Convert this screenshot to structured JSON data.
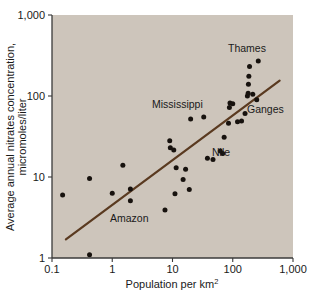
{
  "chart_data": {
    "type": "scatter",
    "title": "",
    "xlabel": "Population per km2",
    "xlabel_base": "Population per km",
    "xlabel_exponent": "2",
    "ylabel": "Average annual nitrates concentration, micromoles/liter",
    "ylabel_line1": "Average annual nitrates concentration,",
    "ylabel_line2": "micromoles/liter",
    "xscale": "log",
    "yscale": "log",
    "xlim": [
      0.1,
      1000
    ],
    "ylim": [
      1,
      1000
    ],
    "xticks": [
      0.1,
      1,
      10,
      100,
      1000
    ],
    "xtick_labels": [
      "0.1",
      "1",
      "10",
      "100",
      "1,000"
    ],
    "yticks": [
      1,
      10,
      100,
      1000
    ],
    "ytick_labels": [
      "1",
      "10",
      "100",
      "1,000"
    ],
    "grid": false,
    "legend": "none",
    "plot_background_color": "#cdc5bb",
    "point_color": "#17120e",
    "trendline_color": "#5a3a20",
    "points": [
      {
        "x": 0.15,
        "y": 6.0
      },
      {
        "x": 0.42,
        "y": 1.1
      },
      {
        "x": 0.42,
        "y": 9.6
      },
      {
        "x": 1.0,
        "y": 6.3
      },
      {
        "x": 1.5,
        "y": 14.0
      },
      {
        "x": 2.0,
        "y": 5.1
      },
      {
        "x": 2.0,
        "y": 7.1
      },
      {
        "x": 7.5,
        "y": 3.9
      },
      {
        "x": 9.0,
        "y": 28.0
      },
      {
        "x": 9.2,
        "y": 23.0
      },
      {
        "x": 10.5,
        "y": 21.5
      },
      {
        "x": 11.0,
        "y": 6.2
      },
      {
        "x": 11.5,
        "y": 13.0
      },
      {
        "x": 15.0,
        "y": 9.3
      },
      {
        "x": 16.5,
        "y": 12.5
      },
      {
        "x": 19.0,
        "y": 7.0
      },
      {
        "x": 20.0,
        "y": 52.0
      },
      {
        "x": 33.0,
        "y": 55.0
      },
      {
        "x": 38.0,
        "y": 17.0
      },
      {
        "x": 47.0,
        "y": 16.5
      },
      {
        "x": 62.0,
        "y": 21.0
      },
      {
        "x": 68.0,
        "y": 19.5
      },
      {
        "x": 72.0,
        "y": 31.0
      },
      {
        "x": 85.0,
        "y": 46.0
      },
      {
        "x": 88.0,
        "y": 72.0
      },
      {
        "x": 90.0,
        "y": 82.0
      },
      {
        "x": 100.0,
        "y": 80.0
      },
      {
        "x": 120.0,
        "y": 48.0
      },
      {
        "x": 140.0,
        "y": 49.0
      },
      {
        "x": 160.0,
        "y": 61.0
      },
      {
        "x": 175.0,
        "y": 100.0
      },
      {
        "x": 180.0,
        "y": 108.0
      },
      {
        "x": 182.0,
        "y": 140.0
      },
      {
        "x": 185.0,
        "y": 175.0
      },
      {
        "x": 190.0,
        "y": 232.0
      },
      {
        "x": 215.0,
        "y": 105.0
      },
      {
        "x": 250.0,
        "y": 90.0
      },
      {
        "x": 265.0,
        "y": 270.0
      }
    ],
    "annotations": [
      {
        "label": "Thames",
        "x_px": 228,
        "y_px": 52
      },
      {
        "label": "Ganges",
        "x_px": 247,
        "y_px": 113
      },
      {
        "label": "Mississippi",
        "x_px": 152,
        "y_px": 108
      },
      {
        "label": "Nile",
        "x_px": 212,
        "y_px": 156
      },
      {
        "label": "Amazon",
        "x_px": 110,
        "y_px": 222
      }
    ],
    "trendline": {
      "x_start": 0.17,
      "y_start": 1.7,
      "x_end": 600,
      "y_end": 155
    }
  }
}
